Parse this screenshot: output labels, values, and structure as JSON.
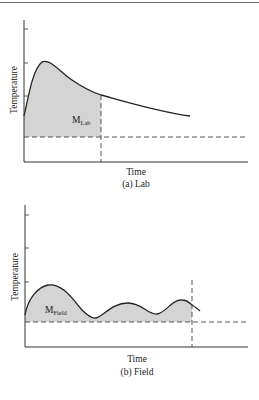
{
  "panels": [
    {
      "id": "lab",
      "caption": "(a) Lab",
      "xlabel": "Time",
      "ylabel": "Temperature",
      "area_label_main": "M",
      "area_label_sub": "Lab"
    },
    {
      "id": "field",
      "caption": "(b) Field",
      "xlabel": "Time",
      "ylabel": "Temperature",
      "area_label_main": "M",
      "area_label_sub": "Field"
    }
  ],
  "colors": {
    "curve": "#222222",
    "fill": "#d4d4d4",
    "axis": "#333333",
    "dashed": "#444444"
  }
}
